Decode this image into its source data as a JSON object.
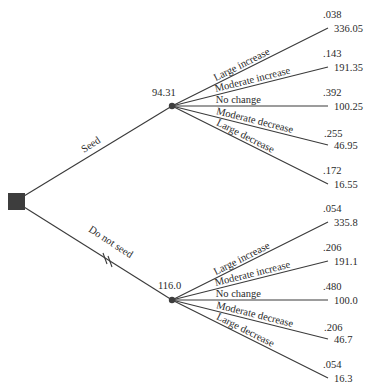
{
  "diagram": {
    "type": "decision-tree",
    "colors": {
      "line": "#3a3a3a",
      "node": "#3d3d3d",
      "text": "#2a2a2a"
    },
    "decision_node": {
      "name": "decision-node"
    },
    "alternatives": [
      {
        "id": "seed",
        "label": "Seed",
        "expected_value": "94.31",
        "blocked": false,
        "outcomes": [
          {
            "label": "Large increase",
            "probability": ".038",
            "value": "336.05"
          },
          {
            "label": "Moderate increase",
            "probability": ".143",
            "value": "191.35"
          },
          {
            "label": "No change",
            "probability": ".392",
            "value": "100.25"
          },
          {
            "label": "Moderate decrease",
            "probability": ".255",
            "value": "46.95"
          },
          {
            "label": "Large decrease",
            "probability": ".172",
            "value": "16.55"
          }
        ]
      },
      {
        "id": "do-not-seed",
        "label": "Do not seed",
        "expected_value": "116.0",
        "blocked": true,
        "outcomes": [
          {
            "label": "Large increase",
            "probability": ".054",
            "value": "335.8"
          },
          {
            "label": "Moderate increase",
            "probability": ".206",
            "value": "191.1"
          },
          {
            "label": "No change",
            "probability": ".480",
            "value": "100.0"
          },
          {
            "label": "Moderate decrease",
            "probability": ".206",
            "value": "46.7"
          },
          {
            "label": "Large decrease",
            "probability": ".054",
            "value": "16.3"
          }
        ]
      }
    ]
  }
}
